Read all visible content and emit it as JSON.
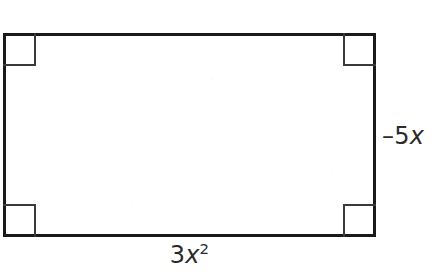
{
  "figure": {
    "type": "geometry-diagram",
    "shape": "rectangle",
    "background_color": "#ffffff",
    "stroke_color": "#1a1a1a",
    "marker_color": "#3a3a3a",
    "text_color": "#2b2b2b",
    "right_angle_markers": 4,
    "marker_names": [
      "top-left-right-angle",
      "top-right-right-angle",
      "bottom-left-right-angle",
      "bottom-right-right-angle"
    ],
    "labels": {
      "right_side": {
        "full_text": "-5x",
        "coefficient": "–5",
        "variable": "x",
        "exponent": ""
      },
      "bottom_side": {
        "full_text": "3x2",
        "coefficient": "3",
        "variable": "x",
        "exponent": "2"
      }
    }
  }
}
